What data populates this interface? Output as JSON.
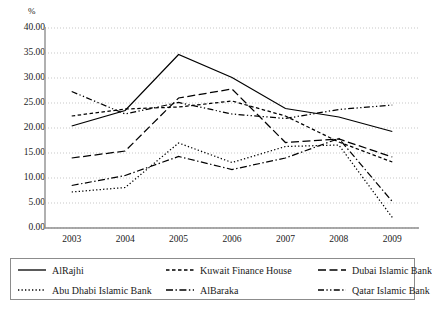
{
  "chart_data": {
    "type": "line",
    "title": "",
    "xlabel": "",
    "ylabel": "%",
    "ylim": [
      0,
      40
    ],
    "ytick_labels": [
      "0.00",
      "5.00",
      "10.00",
      "15.00",
      "20.00",
      "25.00",
      "30.00",
      "35.00",
      "40.00"
    ],
    "ytick_values": [
      0,
      5,
      10,
      15,
      20,
      25,
      30,
      35,
      40
    ],
    "grid": true,
    "legend_position": "bottom",
    "categories": [
      "2003",
      "2004",
      "2005",
      "2006",
      "2007",
      "2008",
      "2009"
    ],
    "x": [
      2003,
      2004,
      2005,
      2006,
      2007,
      2008,
      2009
    ],
    "series": [
      {
        "name": "AlRajhi",
        "dash": "solid",
        "color": "#000000",
        "values": [
          20.4,
          23.5,
          34.7,
          30.1,
          23.9,
          22.2,
          19.3
        ]
      },
      {
        "name": "Kuwait Finance House",
        "dash": "short-dash",
        "color": "#000000",
        "values": [
          22.4,
          23.8,
          24.2,
          25.4,
          22.4,
          17.2,
          13.2
        ]
      },
      {
        "name": "Dubai Islamic Bank",
        "dash": "long-dash",
        "color": "#000000",
        "values": [
          14.0,
          15.4,
          26.0,
          27.8,
          17.1,
          17.8,
          14.2
        ]
      },
      {
        "name": "Abu Dhabi Islamic Bank",
        "dash": "dotted",
        "color": "#000000",
        "values": [
          7.2,
          8.1,
          17.0,
          13.1,
          16.3,
          16.6,
          2.1
        ]
      },
      {
        "name": "AlBaraka",
        "dash": "dash-dot",
        "color": "#000000",
        "values": [
          8.5,
          10.5,
          14.3,
          11.7,
          14.0,
          17.9,
          5.3
        ]
      },
      {
        "name": "Qatar Islamic Bank",
        "dash": "dash-dot-dot",
        "color": "#000000",
        "values": [
          27.3,
          22.8,
          25.1,
          22.8,
          21.9,
          23.7,
          24.6
        ]
      }
    ]
  },
  "axis": {
    "y_title": "%",
    "y_labels": [
      "40.00",
      "35.00",
      "30.00",
      "25.00",
      "20.00",
      "15.00",
      "10.00",
      "5.00",
      "0.00"
    ],
    "x_labels": [
      "2003",
      "2004",
      "2005",
      "2006",
      "2007",
      "2008",
      "2009"
    ]
  },
  "legend": {
    "items": [
      {
        "label": "AlRajhi",
        "style": "solid"
      },
      {
        "label": "Kuwait Finance House",
        "style": "short-dash"
      },
      {
        "label": "Dubai Islamic Bank",
        "style": "long-dash"
      },
      {
        "label": "Abu Dhabi Islamic Bank",
        "style": "dotted"
      },
      {
        "label": "AlBaraka",
        "style": "dash-dot"
      },
      {
        "label": "Qatar Islamic Bank",
        "style": "dash-dot-dot"
      }
    ]
  }
}
